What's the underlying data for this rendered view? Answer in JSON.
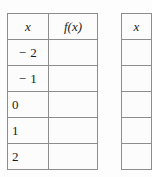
{
  "document": {
    "kind": "function-value-tables",
    "background_color": "#fdfdfd",
    "border_color": "#8d8d8d",
    "text_color": "#1b1b1b"
  },
  "tables": [
    {
      "id": "table-one",
      "headers": [
        "x",
        "f(x)"
      ],
      "rows": [
        {
          "x": "− 2",
          "fx": ""
        },
        {
          "x": "− 1",
          "fx": ""
        },
        {
          "x": "0",
          "fx": ""
        },
        {
          "x": "1",
          "fx": ""
        },
        {
          "x": "2",
          "fx": ""
        }
      ]
    },
    {
      "id": "table-two",
      "clipped": true,
      "headers": [
        "x"
      ],
      "rows": [
        {
          "x": ""
        },
        {
          "x": ""
        },
        {
          "x": ""
        },
        {
          "x": ""
        },
        {
          "x": ""
        }
      ]
    }
  ]
}
